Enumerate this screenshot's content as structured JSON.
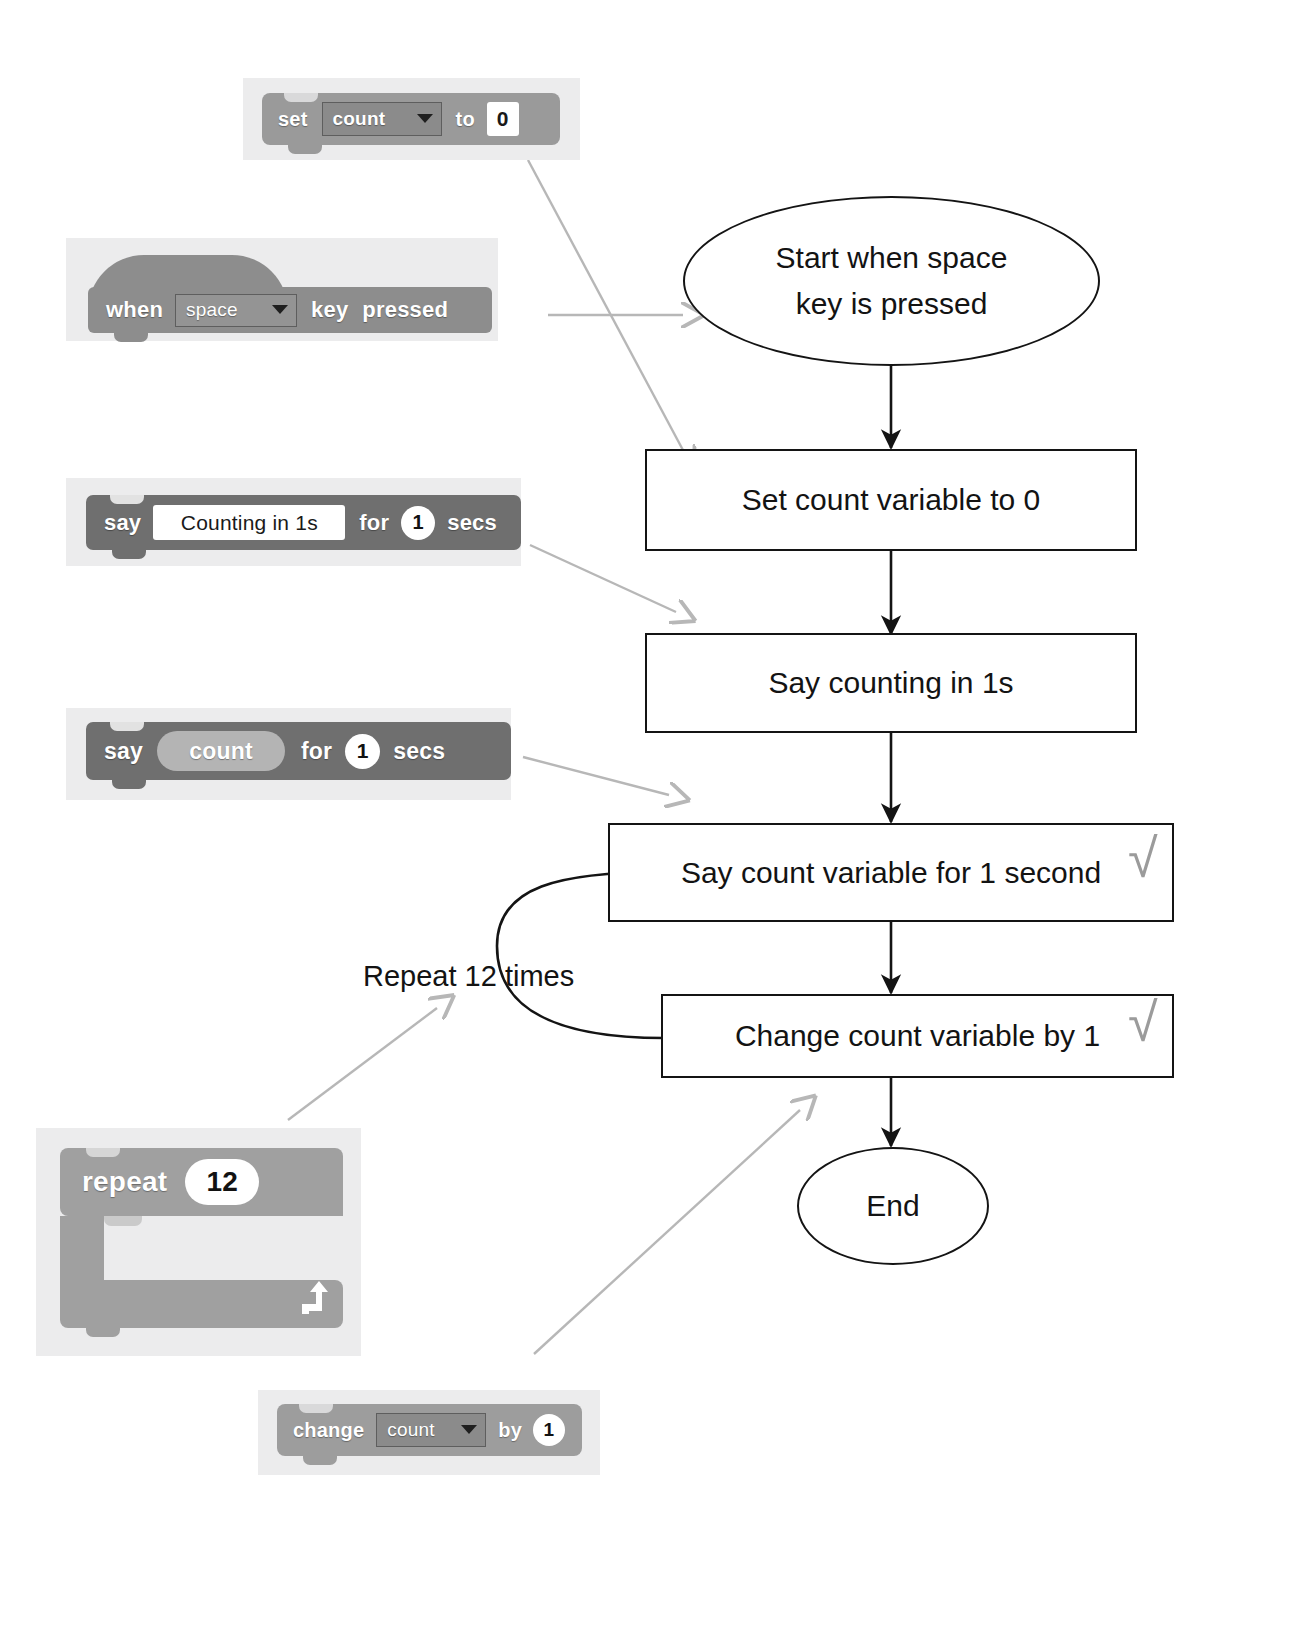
{
  "document": {
    "title": "Scratch blocks mapped to a counting flowchart",
    "accent_gray": "#9a9a9a",
    "line_color": "#141414",
    "annotation_color": "#b7b7b7"
  },
  "blocks": [
    {
      "id": "set-count-to-0",
      "kind": "variable",
      "words": {
        "lead": "set",
        "mid": "to"
      },
      "dropdown_value": "count",
      "value_field": "0"
    },
    {
      "id": "when-space-key-pressed",
      "kind": "event",
      "words": {
        "lead": "when",
        "mid": "key",
        "tail": "pressed"
      },
      "dropdown_value": "space"
    },
    {
      "id": "say-counting-in-1s-for-1-secs",
      "kind": "looks",
      "words": {
        "lead": "say",
        "mid": "for",
        "tail": "secs"
      },
      "text_field": "Counting in 1s",
      "value_field": "1"
    },
    {
      "id": "say-count-for-1-secs",
      "kind": "looks",
      "words": {
        "lead": "say",
        "mid": "for",
        "tail": "secs"
      },
      "reporter": "count",
      "value_field": "1"
    },
    {
      "id": "repeat-12",
      "kind": "control",
      "words": {
        "lead": "repeat"
      },
      "value_field": "12",
      "loop_arrow_icon": "loop-arrow-icon"
    },
    {
      "id": "change-count-by-1",
      "kind": "variable",
      "words": {
        "lead": "change",
        "mid": "by"
      },
      "dropdown_value": "count",
      "value_field": "1"
    }
  ],
  "flowchart": {
    "type": "flowchart",
    "nodes": [
      {
        "id": "start",
        "shape": "oval",
        "line1": "Start when space",
        "line2": "key is pressed"
      },
      {
        "id": "set-count",
        "shape": "rectangle",
        "text": "Set count variable to 0"
      },
      {
        "id": "say-counting",
        "shape": "rectangle",
        "text": "Say counting in 1s"
      },
      {
        "id": "say-count",
        "shape": "rectangle",
        "text": "Say count variable for 1 second",
        "marked": true
      },
      {
        "id": "change-count",
        "shape": "rectangle",
        "text": "Change count variable by 1",
        "marked": true
      },
      {
        "id": "end",
        "shape": "oval",
        "text": "End"
      }
    ],
    "loop_label": "Repeat 12 times",
    "check_mark": "√"
  }
}
